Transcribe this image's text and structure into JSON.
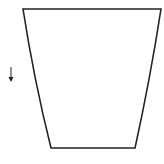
{
  "diagram": {
    "shape": {
      "name": "flared-vessel-outline",
      "stroke": "#222222",
      "fill": "#ffffff",
      "top_left": [
        23,
        9
      ],
      "top_right": [
        161,
        9
      ],
      "bottom_right": [
        135,
        148
      ],
      "bottom_left": [
        51,
        148
      ]
    },
    "arrow": {
      "name": "down-arrow",
      "direction": "down",
      "color": "#222222",
      "x": 11,
      "y_start": 67,
      "y_end": 82
    },
    "caption": ""
  }
}
